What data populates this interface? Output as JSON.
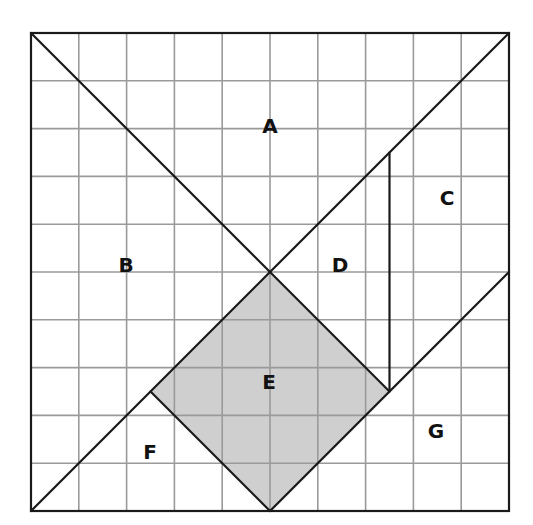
{
  "diagram": {
    "type": "tangram-grid",
    "grid": {
      "rows": 10,
      "cols": 10
    },
    "colors": {
      "grid_line": "#9a9a9a",
      "outline": "#1a1a1a",
      "shaded_fill": "#cfcfcf",
      "background": "#ffffff"
    },
    "regions": [
      {
        "id": "A",
        "label": "A",
        "shaded": false
      },
      {
        "id": "B",
        "label": "B",
        "shaded": false
      },
      {
        "id": "C",
        "label": "C",
        "shaded": false
      },
      {
        "id": "D",
        "label": "D",
        "shaded": false
      },
      {
        "id": "E",
        "label": "E",
        "shaded": true
      },
      {
        "id": "F",
        "label": "F",
        "shaded": false
      },
      {
        "id": "G",
        "label": "G",
        "shaded": false
      }
    ]
  }
}
